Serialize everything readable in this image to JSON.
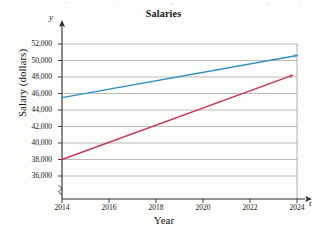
{
  "chart_data": {
    "type": "line",
    "title": "Salaries",
    "xlabel": "Year",
    "ylabel": "Salary (dollars)",
    "x_axis_variable": "t",
    "y_axis_variable": "y",
    "x": [
      2014,
      2016,
      2018,
      2020,
      2022,
      2024
    ],
    "xtick_labels": [
      "2014",
      "2016",
      "2018",
      "2020",
      "2022",
      "2024"
    ],
    "ytick_labels": [
      "36,000",
      "38,000",
      "40,000",
      "42,000",
      "44,000",
      "46,000",
      "48,000",
      "50,000",
      "52,000"
    ],
    "ytick_values": [
      36000,
      38000,
      40000,
      42000,
      44000,
      46000,
      48000,
      50000,
      52000
    ],
    "xlim": [
      2013.2,
      2024.6
    ],
    "ylim": [
      34800,
      52800
    ],
    "y_axis_break": true,
    "grid": "horizontal",
    "legend": "none",
    "series": [
      {
        "name": "blue-line",
        "color": "#2E8FC0",
        "arrow_end": true,
        "points": [
          {
            "x": 2014,
            "y": 45500
          },
          {
            "x": 2024,
            "y": 50600
          }
        ]
      },
      {
        "name": "red-line",
        "color": "#C9355E",
        "arrow_end": true,
        "points": [
          {
            "x": 2014,
            "y": 38000
          },
          {
            "x": 2023.8,
            "y": 48200
          }
        ]
      }
    ]
  }
}
